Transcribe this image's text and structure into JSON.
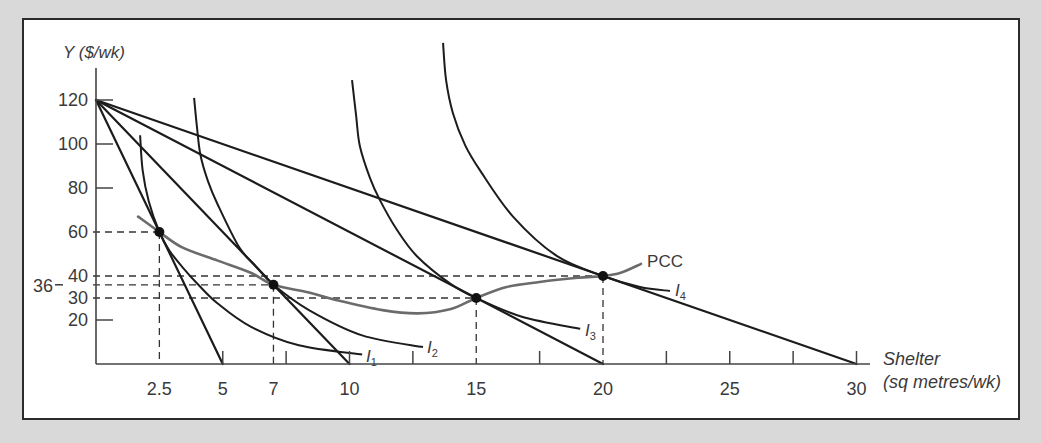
{
  "figure": {
    "y_axis_title": "Y ($/wk)",
    "x_axis_title_line1": "Shelter",
    "x_axis_title_line2": "(sq metres/wk)"
  },
  "chart_data": {
    "type": "line",
    "title": "",
    "xlabel": "Shelter (sq metres/wk)",
    "ylabel": "Y ($/wk)",
    "xlim": [
      0,
      30
    ],
    "ylim": [
      0,
      120
    ],
    "grid": false,
    "legend": "none (curves labelled inline)",
    "x_ticks": [
      5,
      7.5,
      10,
      12.5,
      17.5,
      22.5,
      25,
      27.5,
      30
    ],
    "x_tick_labels": [
      {
        "value": 2.5,
        "label": "2.5"
      },
      {
        "value": 5,
        "label": "5"
      },
      {
        "value": 7,
        "label": "7"
      },
      {
        "value": 10,
        "label": "10"
      },
      {
        "value": 15,
        "label": "15"
      },
      {
        "value": 20,
        "label": "20"
      },
      {
        "value": 25,
        "label": "25"
      },
      {
        "value": 30,
        "label": "30"
      }
    ],
    "y_ticks": [
      120,
      100,
      80,
      20
    ],
    "y_tick_labels": [
      {
        "value": 120,
        "label": "120"
      },
      {
        "value": 100,
        "label": "100"
      },
      {
        "value": 80,
        "label": "80"
      },
      {
        "value": 60,
        "label": "60"
      },
      {
        "value": 40,
        "label": "40"
      },
      {
        "value": 36,
        "label": "36",
        "outside": true
      },
      {
        "value": 30,
        "label": "30"
      },
      {
        "value": 20,
        "label": "20"
      }
    ],
    "budget_lines": [
      {
        "name": "budget-line-1",
        "intercept_y": 120,
        "intercept_x": 5
      },
      {
        "name": "budget-line-2",
        "intercept_y": 120,
        "intercept_x": 10
      },
      {
        "name": "budget-line-3",
        "intercept_y": 120,
        "intercept_x": 20
      },
      {
        "name": "budget-line-4",
        "intercept_y": 120,
        "intercept_x": 30
      }
    ],
    "indifference_curves": [
      {
        "name": "I1",
        "label": "I",
        "subscript": "1",
        "label_at": [
          10.65,
          0.9
        ],
        "points": [
          [
            1.74,
            104
          ],
          [
            1.84,
            88
          ],
          [
            2.08,
            74
          ],
          [
            2.5,
            60
          ],
          [
            2.9,
            51.5
          ],
          [
            3.45,
            43.5
          ],
          [
            4.0,
            36.5
          ],
          [
            4.8,
            27.5
          ],
          [
            6.1,
            17
          ],
          [
            8.0,
            8.5
          ],
          [
            10.5,
            4.3
          ]
        ]
      },
      {
        "name": "I2",
        "label": "I",
        "subscript": "2",
        "label_at": [
          13.06,
          5.0
        ],
        "points": [
          [
            3.87,
            121
          ],
          [
            3.98,
            108
          ],
          [
            4.12,
            95
          ],
          [
            4.42,
            83
          ],
          [
            4.8,
            72.5
          ],
          [
            5.65,
            53
          ],
          [
            6.3,
            44.5
          ],
          [
            7,
            36
          ],
          [
            8.4,
            24.5
          ],
          [
            10.5,
            13
          ],
          [
            12.9,
            7.7
          ]
        ]
      },
      {
        "name": "I3",
        "label": "I",
        "subscript": "3",
        "label_at": [
          19.29,
          12.7
        ],
        "points": [
          [
            10.1,
            129
          ],
          [
            10.26,
            113
          ],
          [
            10.41,
            99
          ],
          [
            10.81,
            84.5
          ],
          [
            11.2,
            74.5
          ],
          [
            11.87,
            61
          ],
          [
            12.66,
            49
          ],
          [
            14,
            36.3
          ],
          [
            15,
            30
          ],
          [
            16.8,
            21.5
          ],
          [
            19.1,
            16
          ]
        ]
      },
      {
        "name": "I4",
        "label": "I",
        "subscript": "4",
        "label_at": [
          22.84,
          30.9
        ],
        "points": [
          [
            13.69,
            146
          ],
          [
            13.81,
            129
          ],
          [
            14.08,
            114
          ],
          [
            14.56,
            99.5
          ],
          [
            15.15,
            88
          ],
          [
            16.45,
            67
          ],
          [
            18.19,
            49
          ],
          [
            20,
            40
          ],
          [
            21.46,
            35
          ],
          [
            22.64,
            33.2
          ]
        ]
      }
    ],
    "price_consumption_curve": {
      "name": "PCC",
      "label": "PCC",
      "label_at": [
        21.74,
        44.1
      ],
      "points": [
        [
          1.66,
          67
        ],
        [
          2.5,
          60
        ],
        [
          3.4,
          53
        ],
        [
          4.8,
          47
        ],
        [
          6.1,
          41.5
        ],
        [
          7,
          36
        ],
        [
          8.4,
          32.5
        ],
        [
          9.5,
          29
        ],
        [
          11.3,
          24.5
        ],
        [
          12.7,
          23
        ],
        [
          14,
          25
        ],
        [
          15,
          30
        ],
        [
          16.2,
          35
        ],
        [
          17.5,
          37.3
        ],
        [
          19,
          39.2
        ],
        [
          20,
          40
        ],
        [
          20.7,
          41.5
        ],
        [
          21.5,
          45.5
        ]
      ]
    },
    "equilibria": [
      {
        "x": 2.5,
        "y": 60
      },
      {
        "x": 7,
        "y": 36
      },
      {
        "x": 15,
        "y": 30
      },
      {
        "x": 20,
        "y": 40
      }
    ],
    "colors": {
      "line": "#1c1c1c",
      "pcc": "#6b6b6b",
      "guide": "#333333",
      "axis": "#444444",
      "text": "#3a3a3a",
      "plot_background": "#ffffff",
      "page_background": "#d9d9d9"
    }
  }
}
